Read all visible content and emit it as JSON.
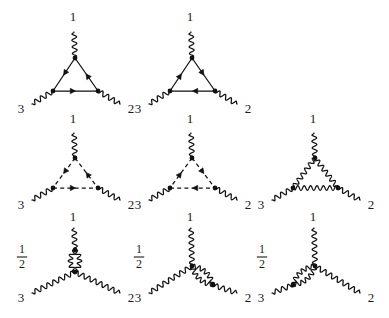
{
  "figure": {
    "background_color": "#ffffff",
    "line_color": "#111111",
    "rows": 3,
    "columns": 3,
    "total_diagrams": 8
  },
  "labels": {
    "leg1": "1",
    "leg2": "2",
    "leg3": "3",
    "half_numerator": "1",
    "half_denominator": "2"
  },
  "diagrams": [
    {
      "id": "d1",
      "row": 1,
      "col": 1,
      "prefactor": null,
      "loop_type": "fermion-triangle",
      "loop_line_style": "solid",
      "loop_arrow_direction": "clockwise",
      "external_legs": [
        "1",
        "3",
        "2"
      ],
      "external_leg_style": "wavy",
      "vertices": 3
    },
    {
      "id": "d2",
      "row": 1,
      "col": 2,
      "prefactor": null,
      "loop_type": "fermion-triangle",
      "loop_line_style": "solid",
      "loop_arrow_direction": "counterclockwise",
      "external_legs": [
        "1",
        "3",
        "2"
      ],
      "external_leg_style": "wavy",
      "vertices": 3
    },
    {
      "id": "d3",
      "row": 2,
      "col": 1,
      "prefactor": null,
      "loop_type": "ghost-triangle",
      "loop_line_style": "dashed",
      "loop_arrow_direction": "clockwise",
      "external_legs": [
        "1",
        "3",
        "2"
      ],
      "external_leg_style": "wavy",
      "vertices": 3
    },
    {
      "id": "d4",
      "row": 2,
      "col": 2,
      "prefactor": null,
      "loop_type": "ghost-triangle",
      "loop_line_style": "dashed",
      "loop_arrow_direction": "counterclockwise",
      "external_legs": [
        "1",
        "3",
        "2"
      ],
      "external_leg_style": "wavy",
      "vertices": 3
    },
    {
      "id": "d5",
      "row": 2,
      "col": 3,
      "prefactor": null,
      "loop_type": "gluon-triangle",
      "loop_line_style": "wavy",
      "loop_arrow_direction": null,
      "external_legs": [
        "1",
        "3",
        "2"
      ],
      "external_leg_style": "wavy",
      "vertices": 3
    },
    {
      "id": "d6",
      "row": 3,
      "col": 1,
      "prefactor": "1/2",
      "loop_type": "gluon-bubble",
      "loop_line_style": "wavy",
      "bubble_on_leg": "1",
      "external_legs": [
        "1",
        "3",
        "2"
      ],
      "external_leg_style": "wavy",
      "vertices": 2
    },
    {
      "id": "d7",
      "row": 3,
      "col": 2,
      "prefactor": "1/2",
      "loop_type": "gluon-bubble",
      "loop_line_style": "wavy",
      "bubble_on_leg": "2",
      "external_legs": [
        "1",
        "3",
        "2"
      ],
      "external_leg_style": "wavy",
      "vertices": 2
    },
    {
      "id": "d8",
      "row": 3,
      "col": 3,
      "prefactor": "1/2",
      "loop_type": "gluon-bubble",
      "loop_line_style": "wavy",
      "bubble_on_leg": "3",
      "external_legs": [
        "1",
        "3",
        "2"
      ],
      "external_leg_style": "wavy",
      "vertices": 2
    }
  ]
}
